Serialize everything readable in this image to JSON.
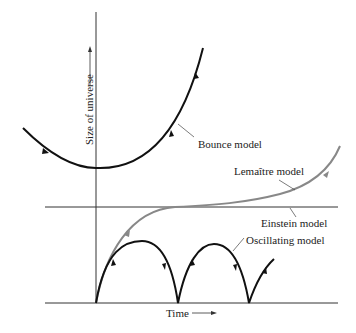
{
  "diagram": {
    "x_axis_label": "Time",
    "y_axis_label": "Size of universe",
    "curves": [
      {
        "name": "bounce",
        "label": "Bounce model",
        "color": "#111111"
      },
      {
        "name": "lemaitre",
        "label": "Lemaître model",
        "color": "#888888"
      },
      {
        "name": "einstein",
        "label": "Einstein model",
        "color": "#333333"
      },
      {
        "name": "oscillating",
        "label": "Oscillating model",
        "color": "#111111"
      }
    ]
  },
  "labels": {
    "bounce": "Bounce model",
    "lemaitre": "Lemaître model",
    "einstein": "Einstein model",
    "oscillating": "Oscillating model",
    "time": "Time",
    "size": "Size of universe"
  }
}
